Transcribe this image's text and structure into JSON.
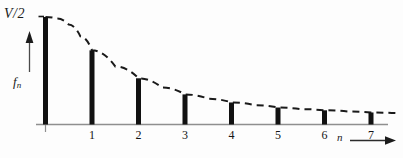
{
  "chart_data": {
    "type": "bar",
    "title": "",
    "subtitle": "",
    "xlabel": "n",
    "ylabel": "f_n",
    "y_top_tick_label": "V/2",
    "categories": [
      "0",
      "1",
      "2",
      "3",
      "4",
      "5",
      "6",
      "7"
    ],
    "x_tick_labels": [
      "1",
      "2",
      "3",
      "4",
      "5",
      "6",
      "7"
    ],
    "values": [
      1.0,
      0.69,
      0.43,
      0.28,
      0.205,
      0.158,
      0.132,
      0.112
    ],
    "ylim": [
      0,
      1.0
    ],
    "xlim": [
      -0.3,
      7.8
    ],
    "grid": false,
    "legend": null,
    "bar_color": "#111111",
    "bar_width_px": 5,
    "envelope": {
      "name": "dashed-envelope",
      "style": "dashed",
      "color": "#1a1a1a",
      "description": "decaying envelope curve through the bar tips",
      "points": [
        [
          0.0,
          1.0
        ],
        [
          0.25,
          0.985
        ],
        [
          0.5,
          0.93
        ],
        [
          0.75,
          0.82
        ],
        [
          1.0,
          0.69
        ],
        [
          1.5,
          0.54
        ],
        [
          2.0,
          0.43
        ],
        [
          2.5,
          0.345
        ],
        [
          3.0,
          0.28
        ],
        [
          3.5,
          0.24
        ],
        [
          4.0,
          0.205
        ],
        [
          4.5,
          0.18
        ],
        [
          5.0,
          0.158
        ],
        [
          5.5,
          0.143
        ],
        [
          6.0,
          0.132
        ],
        [
          6.5,
          0.121
        ],
        [
          7.0,
          0.112
        ],
        [
          7.6,
          0.104
        ]
      ]
    },
    "axes": {
      "x_axis_color": "#8a8a8a",
      "y_axis_arrow": true,
      "x_axis_arrow": true
    }
  },
  "labels": {
    "y_axis_top": "V/2",
    "y_axis_quantity": "f",
    "y_axis_quantity_sub": "n",
    "x_axis_name": "n",
    "tick_1": "1",
    "tick_2": "2",
    "tick_3": "3",
    "tick_4": "4",
    "tick_5": "5",
    "tick_6": "6",
    "tick_7": "7"
  }
}
